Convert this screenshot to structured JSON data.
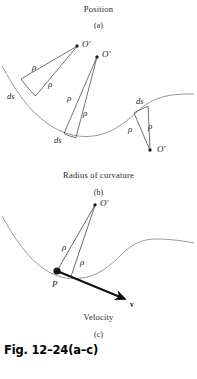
{
  "figure": {
    "reference": "Fig. 12–24(a–c)",
    "panels": [
      {
        "id": "a",
        "letter": "(a)",
        "caption": "Position",
        "caption_position": "above",
        "labels": {
          "center_o_prime": "O'",
          "rho": "ρ",
          "arc_element": "ds"
        }
      },
      {
        "id": "b",
        "letter": "(b)",
        "caption": "Radius of curvature",
        "caption_position": "below",
        "labels": {
          "center_o_prime": "O'",
          "rho": "ρ",
          "arc_element": "ds"
        }
      },
      {
        "id": "c",
        "letter": "(c)",
        "caption": "Velocity",
        "caption_position": "below",
        "labels": {
          "center_o_prime": "O'",
          "rho": "ρ",
          "point": "P",
          "velocity_vector": "v"
        }
      }
    ],
    "colors": {
      "curve": "#8a8a8a",
      "radius_line": "#555555",
      "vector": "#101010",
      "text": "#1c1c1c"
    }
  },
  "panel_a": {
    "title": "Position",
    "letter": "(a)",
    "o_prime_1": "O'",
    "o_prime_2": "O'",
    "o_prime_3": "O'",
    "rho_1": "ρ",
    "rho_2": "ρ",
    "rho_3": "ρ",
    "rho_4": "ρ",
    "rho_5": "ρ",
    "rho_6": "ρ",
    "ds_1": "ds",
    "ds_2": "ds",
    "ds_3": "ds"
  },
  "panel_b": {
    "title": "Radius of curvature",
    "letter": "(b)"
  },
  "panel_c": {
    "title": "Velocity",
    "letter": "(c)",
    "o_prime": "O'",
    "rho_1": "ρ",
    "rho_2": "ρ",
    "point_p": "P",
    "velocity": "v"
  }
}
